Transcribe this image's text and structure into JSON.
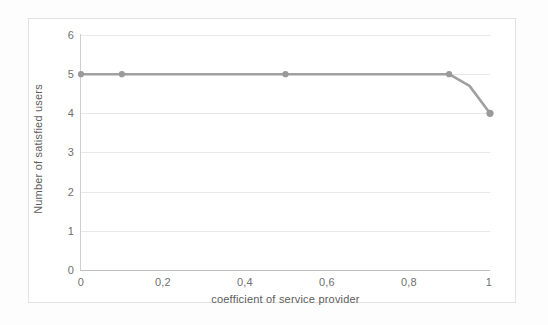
{
  "chart_data": {
    "type": "line",
    "title": "",
    "xlabel": "coefficient of service provider",
    "ylabel": "Number of satisfied users",
    "xlim": [
      0,
      1
    ],
    "ylim": [
      0,
      6
    ],
    "grid": "horizontal",
    "legend": "none",
    "x_tick_labels": [
      "0",
      "0,2",
      "0,4",
      "0,6",
      "0,8",
      "1"
    ],
    "x_ticks": [
      0,
      0.2,
      0.4,
      0.6,
      0.8,
      1
    ],
    "y_tick_labels": [
      "0",
      "1",
      "2",
      "3",
      "4",
      "5",
      "6"
    ],
    "y_ticks": [
      0,
      1,
      2,
      3,
      4,
      5,
      6
    ],
    "series": [
      {
        "name": "satisfied users",
        "color": "#a0a0a0",
        "marker": "circle",
        "x": [
          0,
          0.1,
          0.2,
          0.3,
          0.4,
          0.5,
          0.6,
          0.7,
          0.8,
          0.9,
          0.95,
          1
        ],
        "values": [
          5,
          5,
          5,
          5,
          5,
          5,
          5,
          5,
          5,
          5,
          4.7,
          4
        ],
        "marker_x": [
          0,
          0.1,
          0.5,
          0.9,
          1
        ],
        "marker_values": [
          5,
          5,
          5,
          5,
          4
        ]
      }
    ]
  },
  "colors": {
    "line": "#a0a0a0",
    "marker": "#9a9a9a",
    "gridline": "#e8e8e8",
    "axis": "#bdbdbd",
    "tick_text": "#6f6f6f",
    "title_text": "#5d5d5d",
    "frame": "#e2e2e2",
    "background": "#ffffff"
  }
}
